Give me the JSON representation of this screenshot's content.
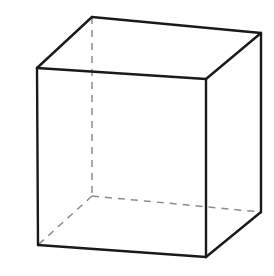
{
  "figure": {
    "type": "line-drawing",
    "canvas": {
      "width": 274,
      "height": 276,
      "background_color": "#ffffff"
    },
    "style": {
      "visible_edge_color": "#1a1a1a",
      "visible_edge_width": 2.4,
      "hidden_edge_color": "#8c8c8c",
      "hidden_edge_width": 1.5,
      "hidden_edge_dash": "7 6",
      "face_fill_color": "#ffffff"
    },
    "vertices": {
      "top_front_left": {
        "name": "top-front-left",
        "x": 37,
        "y": 68,
        "hidden": false
      },
      "top_front_right": {
        "name": "top-front-right",
        "x": 206,
        "y": 79,
        "hidden": false
      },
      "top_back_left": {
        "name": "top-back-left",
        "x": 92,
        "y": 17,
        "hidden": false
      },
      "top_back_right": {
        "name": "top-back-right",
        "x": 261,
        "y": 33,
        "hidden": false
      },
      "bottom_front_left": {
        "name": "bottom-front-left",
        "x": 38,
        "y": 245,
        "hidden": false
      },
      "bottom_front_right": {
        "name": "bottom-front-right",
        "x": 206,
        "y": 257,
        "hidden": false
      },
      "bottom_back_left": {
        "name": "bottom-back-left",
        "x": 92,
        "y": 196,
        "hidden": true
      },
      "bottom_back_right": {
        "name": "bottom-back-right",
        "x": 261,
        "y": 212,
        "hidden": false
      }
    },
    "faces": {
      "front": {
        "name": "front-face",
        "points": "37,68 206,79 206,257 38,245"
      },
      "top": {
        "name": "top-face",
        "points": "37,68 92,17 261,33 206,79"
      },
      "right": {
        "name": "right-face",
        "points": "206,79 261,33 261,212 206,257"
      }
    },
    "edges": {
      "visible": [
        {
          "name": "edge-top-front",
          "d": "M 37,68 L 206,79"
        },
        {
          "name": "edge-front-right",
          "d": "M 206,79 L 206,257"
        },
        {
          "name": "edge-bottom-front",
          "d": "M 38,245 L 206,257"
        },
        {
          "name": "edge-front-left",
          "d": "M 37,68 L 38,245"
        },
        {
          "name": "edge-top-left-back",
          "d": "M 37,68 L 92,17"
        },
        {
          "name": "edge-top-back",
          "d": "M 92,17 L 261,33"
        },
        {
          "name": "edge-top-right-back",
          "d": "M 206,79 L 261,33"
        },
        {
          "name": "edge-back-right",
          "d": "M 261,33 L 261,212"
        },
        {
          "name": "edge-bottom-right-back",
          "d": "M 261,212 L 206,257"
        }
      ],
      "hidden": [
        {
          "name": "edge-back-left-vertical",
          "d": "M 92,17 L 92,196"
        },
        {
          "name": "edge-bottom-back",
          "d": "M 92,196 L 261,212"
        },
        {
          "name": "edge-bottom-left-back",
          "d": "M 92,196 L 38,245"
        }
      ]
    }
  }
}
